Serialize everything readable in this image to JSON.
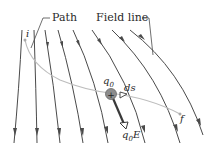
{
  "labels": {
    "path": "Path",
    "field_line": "Field line",
    "initial_point": "i",
    "final_point": "f",
    "charge": "q",
    "charge_sub": "0",
    "charge_sign": "+",
    "displacement": "ds",
    "force": "q",
    "force_sub": "0",
    "force_vec": "E"
  },
  "colors": {
    "field_line": "#4a4a4a",
    "path": "#bdbdbd",
    "charge_fill": "#8c8c8c",
    "text": "#2a2a2a"
  },
  "field_lines_count": 8
}
